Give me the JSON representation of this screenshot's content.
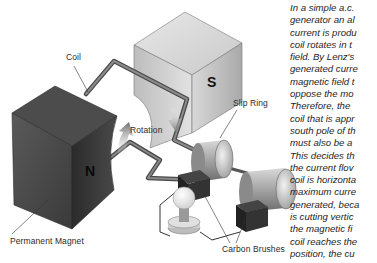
{
  "figure": {
    "title": "Simple a.c. generator",
    "labels": {
      "coil": "Coil",
      "rotation": "Rotation",
      "slip_ring": "Slip Ring",
      "permanent_magnet": "Permanent Magnet",
      "carbon_brushes": "Carbon Brushes"
    },
    "poles": {
      "north": "N",
      "south": "S"
    }
  },
  "body_text": {
    "lines": [
      "In a simple a.c.",
      "generator an al",
      "current is produ",
      "coil rotates in t",
      "field. By Lenz's",
      "generated curre",
      "magnetic field t",
      "oppose the mo",
      "Therefore, the",
      "coil that is appr",
      "south pole of th",
      "must also be a",
      "This decides th",
      "the current flov",
      "coil is horizonta",
      "maximum curre",
      "generated, beca",
      "is cutting vertic",
      "the magnetic fi",
      "coil reaches the",
      "position, the cu"
    ]
  }
}
